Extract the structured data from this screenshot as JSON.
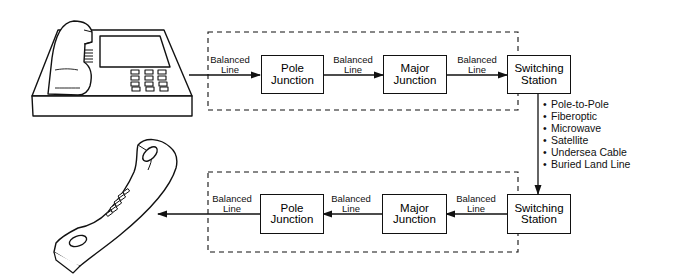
{
  "diagram": {
    "type": "telephone-call-path",
    "top_row": {
      "source_device": "desk-telephone",
      "connections": [
        {
          "label_line1": "Balanced",
          "label_line2": "Line"
        },
        {
          "label_line1": "Balanced",
          "label_line2": "Line"
        },
        {
          "label_line1": "Balanced",
          "label_line2": "Line"
        }
      ],
      "nodes": [
        {
          "line1": "Pole",
          "line2": "Junction"
        },
        {
          "line1": "Major",
          "line2": "Junction"
        },
        {
          "line1": "Switching",
          "line2": "Station"
        }
      ]
    },
    "trunk_media": [
      "Pole-to-Pole",
      "Fiberoptic",
      "Microwave",
      "Satellite",
      "Undersea Cable",
      "Buried Land Line"
    ],
    "bottom_row": {
      "destination_device": "handset",
      "connections": [
        {
          "label_line1": "Balanced",
          "label_line2": "Line"
        },
        {
          "label_line1": "Balanced",
          "label_line2": "Line"
        },
        {
          "label_line1": "Balanced",
          "label_line2": "Line"
        }
      ],
      "nodes": [
        {
          "line1": "Pole",
          "line2": "Junction"
        },
        {
          "line1": "Major",
          "line2": "Junction"
        },
        {
          "line1": "Switching",
          "line2": "Station"
        }
      ]
    },
    "colors": {
      "stroke": "#111111",
      "background": "#ffffff"
    }
  }
}
